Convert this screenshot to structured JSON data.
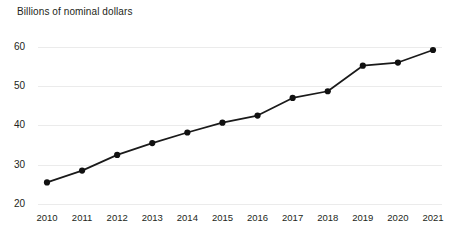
{
  "chart_data": {
    "type": "line",
    "title": "Billions of nominal dollars",
    "xlabel": "",
    "ylabel": "Billions of nominal dollars",
    "categories": [
      "2010",
      "2011",
      "2012",
      "2013",
      "2014",
      "2015",
      "2016",
      "2017",
      "2018",
      "2019",
      "2020",
      "2021"
    ],
    "x": [
      2010,
      2011,
      2012,
      2013,
      2014,
      2015,
      2016,
      2017,
      2018,
      2019,
      2020,
      2021
    ],
    "values": [
      25.5,
      28.5,
      32.5,
      35.5,
      38.2,
      40.7,
      42.5,
      47.0,
      48.7,
      55.2,
      56.0,
      59.2
    ],
    "series": [
      {
        "name": "Nominal dollars",
        "values": [
          25.5,
          28.5,
          32.5,
          35.5,
          38.2,
          40.7,
          42.5,
          47.0,
          48.7,
          55.2,
          56.0,
          59.2
        ]
      }
    ],
    "ylim": [
      20,
      62
    ],
    "yticks": [
      20,
      30,
      40,
      50,
      60
    ],
    "ytick_labels": [
      "20",
      "30",
      "40",
      "50",
      "60"
    ],
    "xtick_labels": [
      "2010",
      "2011",
      "2012",
      "2013",
      "2014",
      "2015",
      "2016",
      "2017",
      "2018",
      "2019",
      "2020",
      "2021"
    ],
    "grid": true,
    "grid_axis": "y",
    "legend": false,
    "legend_position": "none",
    "markers": true,
    "annotations": [],
    "colors": {
      "background": "#ffffff",
      "line": "#1a1a1a",
      "marker": "#111111",
      "gridline": "#ebebeb",
      "text": "#231f20"
    }
  }
}
